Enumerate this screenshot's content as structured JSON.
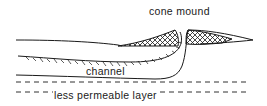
{
  "diagram": {
    "labels": {
      "cone_mound": "cone mound",
      "channel": "channel",
      "less_permeable_layer": "less permeable layer"
    },
    "colors": {
      "ink": "#1a1a1a",
      "background": "#ffffff"
    }
  }
}
